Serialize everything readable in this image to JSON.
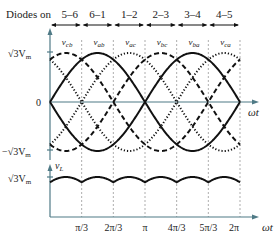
{
  "header": {
    "diodes_label": "Diodes on",
    "intervals": [
      "5–6",
      "6–1",
      "1–2",
      "2–3",
      "3–4",
      "4–5"
    ]
  },
  "top_plot": {
    "y_max_label": "√3V",
    "y_max_sub": "m",
    "y_zero_label": "0",
    "y_min_label": "−√3V",
    "y_min_sub": "m",
    "x_axis_label": "ωt",
    "curves": [
      {
        "name": "v",
        "sub": "cb",
        "style": "dashed"
      },
      {
        "name": "v",
        "sub": "ab",
        "style": "solid"
      },
      {
        "name": "v",
        "sub": "ac",
        "style": "dotted"
      },
      {
        "name": "v",
        "sub": "bc",
        "style": "dashed"
      },
      {
        "name": "v",
        "sub": "ba",
        "style": "solid"
      },
      {
        "name": "v",
        "sub": "ca",
        "style": "dotted"
      }
    ]
  },
  "bottom_plot": {
    "y_axis_label": "v",
    "y_axis_sub": "L",
    "y_max_label": "√3V",
    "y_max_sub": "m",
    "x_axis_label": "ωt",
    "x_ticks": [
      "π/3",
      "2π/3",
      "π",
      "4π/3",
      "5π/3",
      "2π"
    ]
  },
  "colors": {
    "axis": "#4f7a86",
    "curve": "#111111",
    "grid": "#777777"
  }
}
